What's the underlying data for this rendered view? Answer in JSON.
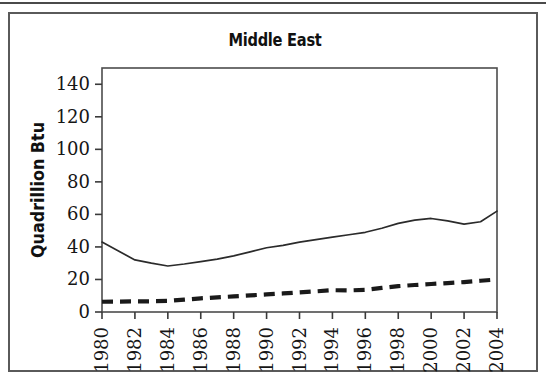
{
  "figure": {
    "title": "Middle East",
    "frame_color": "#5a5a5a",
    "background": "#ffffff"
  },
  "chart_data": {
    "type": "line",
    "title": "Middle East",
    "xlabel": "",
    "ylabel": "Quadrillion Btu",
    "ylim": [
      0,
      150
    ],
    "yticks": [
      0,
      20,
      40,
      60,
      80,
      100,
      120,
      140
    ],
    "ytick_labels": [
      "0",
      "20",
      "40",
      "60",
      "80",
      "100",
      "120",
      "140"
    ],
    "xlim": [
      1980,
      2004
    ],
    "xticks": [
      1980,
      1982,
      1984,
      1986,
      1988,
      1990,
      1992,
      1994,
      1996,
      1998,
      2000,
      2002,
      2004
    ],
    "xtick_labels": [
      "1980",
      "1982",
      "1984",
      "1986",
      "1988",
      "1990",
      "1992",
      "1994",
      "1996",
      "1998",
      "2000",
      "2002",
      "2004"
    ],
    "xtick_rotation": 90,
    "grid": false,
    "legend": "none",
    "x": [
      1980,
      1981,
      1982,
      1983,
      1984,
      1985,
      1986,
      1987,
      1988,
      1989,
      1990,
      1991,
      1992,
      1993,
      1994,
      1995,
      1996,
      1997,
      1998,
      1999,
      2000,
      2001,
      2002,
      2003,
      2004
    ],
    "series": [
      {
        "name": "Production",
        "style": "solid",
        "color": "#2b2b2b",
        "values": [
          43.0,
          37.5,
          32.0,
          30.0,
          28.3,
          29.5,
          31.0,
          32.5,
          34.5,
          37.0,
          39.5,
          41.0,
          43.0,
          44.5,
          46.0,
          47.5,
          49.0,
          51.5,
          54.5,
          56.5,
          57.5,
          56.0,
          54.0,
          55.5,
          62.0
        ]
      },
      {
        "name": "Consumption",
        "style": "dashed",
        "color": "#1a1a1a",
        "values": [
          6.3,
          6.4,
          6.5,
          6.6,
          6.8,
          7.6,
          8.4,
          9.0,
          9.6,
          10.2,
          10.8,
          11.4,
          12.1,
          12.7,
          13.4,
          13.3,
          13.6,
          14.8,
          15.9,
          16.6,
          17.2,
          17.8,
          18.4,
          19.2,
          20.0
        ]
      }
    ]
  }
}
